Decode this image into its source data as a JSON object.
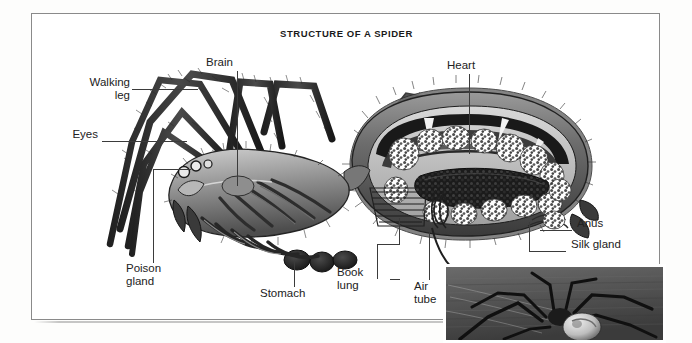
{
  "figure": {
    "title": "STRUCTURE OF A SPIDER",
    "kind": "labeled anatomical cutaway diagram with photograph inset",
    "frame_color": "#8a8a8a",
    "background_color": "#ffffff",
    "text_color": "#222222",
    "leader_line_color": "#3b3b3b"
  },
  "labels": [
    {
      "id": "walking-leg",
      "text": "Walking\nleg"
    },
    {
      "id": "brain",
      "text": "Brain"
    },
    {
      "id": "heart",
      "text": "Heart"
    },
    {
      "id": "eyes",
      "text": "Eyes"
    },
    {
      "id": "anus",
      "text": "Anus"
    },
    {
      "id": "silk-gland",
      "text": "Silk gland"
    },
    {
      "id": "poison-gland",
      "text": "Poison\ngland"
    },
    {
      "id": "stomach",
      "text": "Stomach"
    },
    {
      "id": "book-lung",
      "text": "Book\nlung"
    },
    {
      "id": "air-tube",
      "text": "Air\ntube"
    }
  ],
  "photo_inset": {
    "caption": "",
    "description": "black and white photograph of a live spider on a dark background"
  }
}
